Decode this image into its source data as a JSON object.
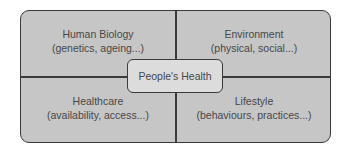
{
  "diagram": {
    "center": {
      "label": "People's Health"
    },
    "quadrants": [
      {
        "position": "top-left",
        "title": "Human Biology",
        "subtitle": "(genetics, ageing...)"
      },
      {
        "position": "top-right",
        "title": "Environment",
        "subtitle": "(physical, social...)"
      },
      {
        "position": "bottom-left",
        "title": "Healthcare",
        "subtitle": "(availability, access...)"
      },
      {
        "position": "bottom-right",
        "title": "Lifestyle",
        "subtitle": "(behaviours, practices...)"
      }
    ],
    "colors": {
      "fill": "#c6c6c6",
      "center_fill": "#dcdcdc",
      "border": "#3a3a3a",
      "text": "#474747"
    }
  }
}
